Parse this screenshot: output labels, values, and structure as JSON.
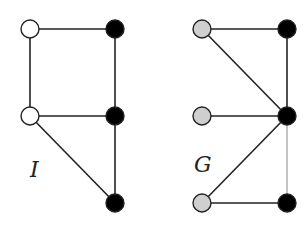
{
  "graphs": [
    {
      "id": "I",
      "label": "I",
      "label_pos": [
        30,
        157
      ],
      "nodes": [
        {
          "id": "a",
          "x": 30,
          "y": 29,
          "fill": "#ffffff"
        },
        {
          "id": "b",
          "x": 30,
          "y": 116,
          "fill": "#ffffff"
        },
        {
          "id": "c",
          "x": 115,
          "y": 29,
          "fill": "#000000"
        },
        {
          "id": "d",
          "x": 115,
          "y": 116,
          "fill": "#000000"
        },
        {
          "id": "e",
          "x": 115,
          "y": 203,
          "fill": "#000000"
        }
      ],
      "edges": [
        [
          "a",
          "c"
        ],
        [
          "a",
          "b"
        ],
        [
          "b",
          "d"
        ],
        [
          "c",
          "d"
        ],
        [
          "d",
          "e"
        ],
        [
          "b",
          "e"
        ]
      ]
    },
    {
      "id": "G",
      "label": "G",
      "label_pos": [
        194,
        152
      ],
      "nodes": [
        {
          "id": "p",
          "x": 202,
          "y": 29,
          "fill": "#cfcfcf"
        },
        {
          "id": "q",
          "x": 202,
          "y": 116,
          "fill": "#cfcfcf"
        },
        {
          "id": "r",
          "x": 202,
          "y": 203,
          "fill": "#cfcfcf"
        },
        {
          "id": "s",
          "x": 287,
          "y": 29,
          "fill": "#000000"
        },
        {
          "id": "t",
          "x": 287,
          "y": 116,
          "fill": "#000000"
        },
        {
          "id": "u",
          "x": 287,
          "y": 203,
          "fill": "#000000"
        }
      ],
      "edges": [
        [
          "p",
          "s"
        ],
        [
          "p",
          "t"
        ],
        [
          "s",
          "t"
        ],
        [
          "q",
          "t"
        ],
        [
          "r",
          "t"
        ],
        [
          "r",
          "u"
        ],
        [
          "t",
          "u"
        ]
      ],
      "thin_edges": [
        [
          "t",
          "u"
        ]
      ]
    }
  ],
  "style": {
    "edge_color": "#222222",
    "node_stroke": "#222222",
    "node_radius": 9
  }
}
